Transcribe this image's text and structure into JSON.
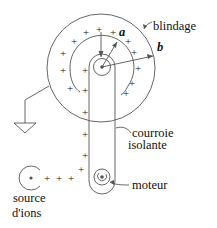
{
  "diagram": {
    "type": "van-de-graaff-generator",
    "labels": {
      "shield": "blindage",
      "radius_inner": "a",
      "radius_outer": "b",
      "belt_line1": "courroie",
      "belt_line2": "isolante",
      "motor": "moteur",
      "source_line1": "source",
      "source_line2": "d'ions"
    },
    "charge_symbol": "+",
    "colors": {
      "stroke": "#555555",
      "text": "#111111",
      "background": "#ffffff"
    }
  }
}
